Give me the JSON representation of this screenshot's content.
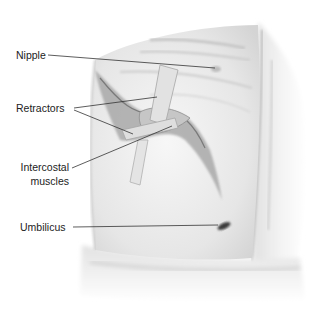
{
  "diagram": {
    "labels": [
      {
        "id": "nipple",
        "text": "Nipple"
      },
      {
        "id": "retractors",
        "text": "Retractors"
      },
      {
        "id": "intercostal_line1",
        "text": "Intercostal"
      },
      {
        "id": "intercostal_line2",
        "text": "muscles"
      },
      {
        "id": "umbilicus",
        "text": "Umbilicus"
      }
    ],
    "colors": {
      "background": "#ffffff",
      "skin": "#ececec",
      "shadow": "#9a9a9a",
      "leader_line": "#333333",
      "text": "#222222"
    }
  }
}
